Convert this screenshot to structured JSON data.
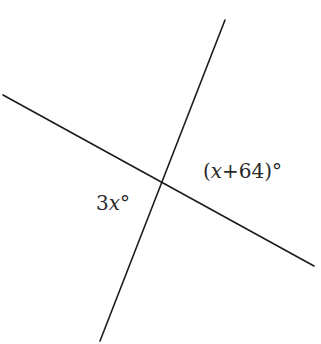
{
  "diagram": {
    "type": "intersecting-lines",
    "lines": [
      {
        "name": "line-a",
        "from": [
          3,
          95
        ],
        "to": [
          314,
          266
        ]
      },
      {
        "name": "line-b",
        "from": [
          225,
          20
        ],
        "to": [
          100,
          341
        ]
      }
    ],
    "intersection": [
      162,
      182
    ],
    "angle_labels": [
      {
        "name": "angle-right",
        "text_open": "(",
        "variable": "x",
        "text_rest": "+64)",
        "degree": "°",
        "position": [
          203,
          178
        ]
      },
      {
        "name": "angle-left",
        "coefficient": "3",
        "variable": "x",
        "degree": "°",
        "position": [
          96,
          210
        ]
      }
    ]
  }
}
